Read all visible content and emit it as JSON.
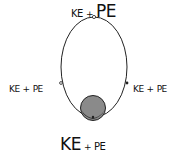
{
  "diagram": {
    "top_label": {
      "ke": "KE",
      "plus": "+",
      "pe": "PE"
    },
    "left_label": {
      "ke": "KE",
      "plus": "+",
      "pe": "PE"
    },
    "right_label": {
      "ke": "KE",
      "plus": "+",
      "pe": "PE"
    },
    "bottom_label": {
      "ke": "KE",
      "plus": "+",
      "pe": "PE"
    },
    "colors": {
      "line": "#222222",
      "ball": "#8a8a8a",
      "ball_shadow": "#2b2b2b"
    }
  }
}
